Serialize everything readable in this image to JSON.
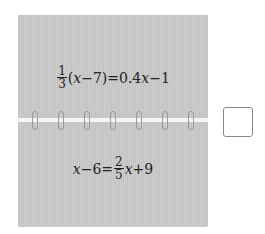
{
  "flip_cards": {
    "top": {
      "equation": {
        "frac_num": "1",
        "frac_den": "3",
        "rest_parts": [
          "(",
          "x",
          "−7)=0.4",
          "x",
          "−1"
        ]
      }
    },
    "bottom": {
      "equation": {
        "lhs_var": "x",
        "lhs_rest": "−6=",
        "frac_num": "2",
        "frac_den": "5",
        "rhs_var": "x",
        "rhs_rest": "+9"
      }
    },
    "ring_count": 7
  },
  "answer_box": {
    "value": ""
  },
  "colors": {
    "card": "#c9c9c9",
    "text": "#222222",
    "box_border": "#8a8a8a"
  }
}
